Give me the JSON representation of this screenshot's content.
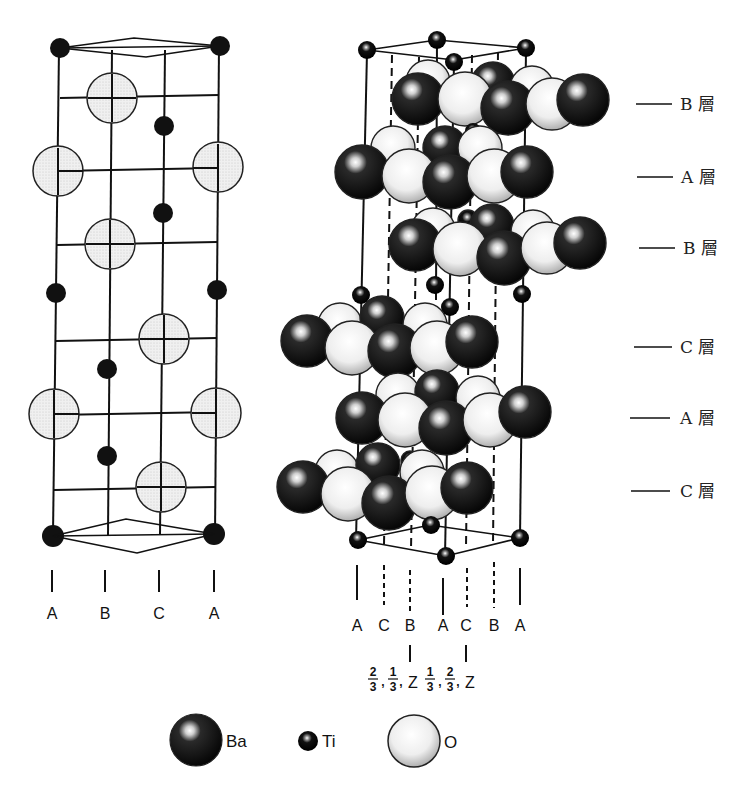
{
  "figure": {
    "left_structure": {
      "column_labels": [
        "A",
        "B",
        "C",
        "A"
      ]
    },
    "right_structure": {
      "column_labels": [
        "A",
        "C",
        "B",
        "A",
        "C",
        "B",
        "A"
      ],
      "coordinates": {
        "first": {
          "num1": "2",
          "den1": "3",
          "num2": "1",
          "den2": "3",
          "z": "Z"
        },
        "second": {
          "num1": "1",
          "den1": "3",
          "num2": "2",
          "den2": "3",
          "z": "Z"
        }
      },
      "layer_labels": [
        "B 層",
        "A 層",
        "B 層",
        "C 層",
        "A 層",
        "C 層"
      ]
    },
    "legend": [
      {
        "atom": "Ba",
        "style": "large-dark-sphere"
      },
      {
        "atom": "Ti",
        "style": "small-dark-sphere"
      },
      {
        "atom": "O",
        "style": "large-light-sphere"
      }
    ]
  },
  "colors": {
    "ba": "#111111",
    "ti": "#111111",
    "o_fill": "#e8e8e8",
    "line": "#111111",
    "background": "#ffffff"
  }
}
